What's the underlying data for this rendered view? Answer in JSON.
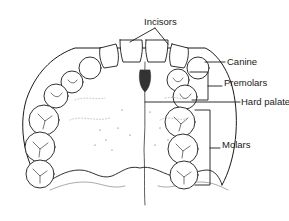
{
  "diagram": {
    "labels": {
      "incisors": "Incisors",
      "canine": "Canine",
      "premolars": "Premolars",
      "hard_palate": "Hard palate",
      "molars": "Molars"
    },
    "colors": {
      "line": "#1a1a1a",
      "stipple": "#777777",
      "background": "#ffffff"
    }
  }
}
